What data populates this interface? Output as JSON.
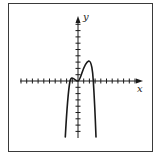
{
  "chart_data": {
    "type": "line",
    "title": "",
    "xlabel": "x",
    "ylabel": "y",
    "grid": false,
    "legend": null,
    "axes": {
      "origin_px": [
        78,
        81
      ],
      "x_tick_spacing_px": 5.7,
      "y_tick_spacing_px": 6.3,
      "x_ticks_left": 10,
      "x_ticks_right": 10,
      "y_ticks_up": 9,
      "y_ticks_down": 8,
      "xlim": [
        -10,
        11
      ],
      "ylim": [
        -9,
        10
      ]
    },
    "series": [
      {
        "name": "f(x)",
        "description": "Even-degree polynomial, negative leading coefficient; both ends go down",
        "key_points": [
          {
            "label": "left end",
            "x": -2.2,
            "y": -9
          },
          {
            "label": "left x-intercept",
            "x": -1.4,
            "y": 0
          },
          {
            "label": "local max",
            "x": -0.9,
            "y": 0.4
          },
          {
            "label": "local min (tangent at origin)",
            "x": 0,
            "y": 0
          },
          {
            "label": "local max",
            "x": 1.9,
            "y": 3.2
          },
          {
            "label": "right x-intercept",
            "x": 2.7,
            "y": 0
          },
          {
            "label": "right end",
            "x": 3.2,
            "y": -9
          }
        ]
      }
    ]
  },
  "labels": {
    "x_axis": "x",
    "y_axis": "y"
  },
  "colors": {
    "stroke": "#1a1a1a",
    "frame": "#3a3a3a",
    "background": "#ffffff"
  }
}
